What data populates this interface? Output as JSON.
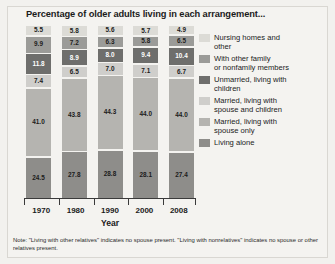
{
  "title": "Percentage of older adults living in each arrangement...",
  "note": "Note: \"Living with other relatives\" indicates no spouse present. \"Living with nonrelatives\" indicates no spouse or other relatives present.",
  "axis_title": "Year",
  "colors": {
    "nursing_homes_and_other": "#dcdbd6",
    "with_other_family_or_nonfamily_members": "#9b9b98",
    "unmarried_living_with_children": "#6e6e6c",
    "married_living_with_spouse_and_children": "#cfcecb",
    "married_living_with_spouse_only": "#b5b4b0",
    "living_alone": "#8e8d8a",
    "label_dark": "#1b1b1b",
    "label_light": "#ffffff",
    "background": "#f4f3f0",
    "axis": "#3a3a3a"
  },
  "legend": [
    {
      "label": "Nursing homes and\nother",
      "color": "#dcdbd6"
    },
    {
      "label": "With other family\nor nonfamily members",
      "color": "#9b9b98"
    },
    {
      "label": "Unmarried, living with\nchildren",
      "color": "#6e6e6c"
    },
    {
      "label": "Married, living with\nspouse and children",
      "color": "#cfcecb"
    },
    {
      "label": "Married, living with\nspouse only",
      "color": "#b5b4b0"
    },
    {
      "label": "Living alone",
      "color": "#8e8d8a"
    }
  ],
  "chart_data": {
    "type": "bar",
    "stacked": true,
    "title": "Percentage of older adults living in each arrangement...",
    "xlabel": "Year",
    "ylabel": "",
    "ylim": [
      0,
      100
    ],
    "grid": false,
    "legend_position": "right",
    "categories": [
      "1970",
      "1980",
      "1990",
      "2000",
      "2008"
    ],
    "series": [
      {
        "name": "Nursing homes and other",
        "color": "#dcdbd6",
        "values": [
          5.5,
          5.8,
          5.6,
          5.7,
          4.9
        ]
      },
      {
        "name": "With other family or nonfamily members",
        "color": "#9b9b98",
        "values": [
          9.9,
          7.2,
          6.3,
          5.8,
          6.5
        ]
      },
      {
        "name": "Unmarried, living with children",
        "color": "#6e6e6c",
        "values": [
          11.8,
          8.9,
          8.0,
          9.4,
          10.4
        ]
      },
      {
        "name": "Married, living with spouse and children",
        "color": "#cfcecb",
        "values": [
          7.4,
          6.5,
          7.0,
          7.1,
          6.7
        ]
      },
      {
        "name": "Married, living with spouse only",
        "color": "#b5b4b0",
        "values": [
          41.0,
          43.8,
          44.3,
          44.0,
          44.0
        ]
      },
      {
        "name": "Living alone",
        "color": "#8e8d8a",
        "values": [
          24.5,
          27.8,
          28.8,
          28.1,
          27.4
        ]
      }
    ],
    "value_labels": {
      "1970": [
        "5.5",
        "9.9",
        "11.8",
        "7.4",
        "41.0",
        "24.5"
      ],
      "1980": [
        "5.8",
        "7.2",
        "8.9",
        "6.5",
        "43.8",
        "27.8"
      ],
      "1990": [
        "5.6",
        "6.3",
        "8.0",
        "7.0",
        "44.3",
        "28.8"
      ],
      "2000": [
        "5.7",
        "5.8",
        "9.4",
        "7.1",
        "44.0",
        "28.1"
      ],
      "2008": [
        "4.9",
        "6.5",
        "10.4",
        "6.7",
        "44.0",
        "27.4"
      ]
    }
  }
}
